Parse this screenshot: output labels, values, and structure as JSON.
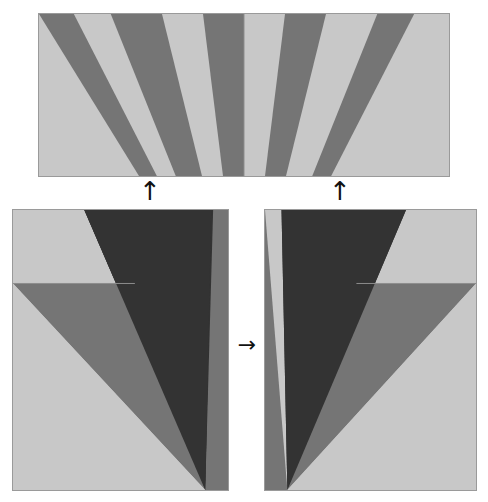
{
  "figure": {
    "title": "",
    "background_color": "#ffffff",
    "width": 488,
    "height": 502
  },
  "palette": {
    "dark": "#333333",
    "mid_dark": "#4a4a4a",
    "mid": "#757575",
    "light": "#c8c8c8",
    "border": "#9a9a9a",
    "arrow": "#111111"
  },
  "arrows": {
    "up_left": {
      "glyph": "↑",
      "label": "up-arrow-left",
      "meaning": "bottom-left panel maps into left half of top panel"
    },
    "up_right": {
      "glyph": "↑",
      "label": "up-arrow-right",
      "meaning": "bottom-right panel maps into right half of top panel"
    },
    "right_mid": {
      "glyph": "→",
      "label": "right-arrow-middle",
      "meaning": "bottom-left panel is mirrored to produce bottom-right panel"
    }
  },
  "panels": {
    "top": {
      "name": "combined-fan-panel",
      "caption": "",
      "halves": [
        "left-fan",
        "right-fan"
      ],
      "divider_x_fraction": 0.5,
      "left_fan": {
        "apex": {
          "x_fraction": 0.5,
          "y_fraction": 2.05
        },
        "wedges": [
          {
            "start_fraction": 0.0,
            "end_fraction": 0.085,
            "color": "#757575"
          },
          {
            "start_fraction": 0.085,
            "end_fraction": 0.175,
            "color": "#c8c8c8"
          },
          {
            "start_fraction": 0.175,
            "end_fraction": 0.3,
            "color": "#757575"
          },
          {
            "start_fraction": 0.3,
            "end_fraction": 0.4,
            "color": "#c8c8c8"
          },
          {
            "start_fraction": 0.4,
            "end_fraction": 0.5,
            "color": "#757575"
          }
        ]
      },
      "right_fan": {
        "apex": {
          "x_fraction": 0.5,
          "y_fraction": 2.05
        },
        "wedges": [
          {
            "start_fraction": 0.5,
            "end_fraction": 0.6,
            "color": "#c8c8c8"
          },
          {
            "start_fraction": 0.6,
            "end_fraction": 0.7,
            "color": "#757575"
          },
          {
            "start_fraction": 0.7,
            "end_fraction": 0.825,
            "color": "#c8c8c8"
          },
          {
            "start_fraction": 0.825,
            "end_fraction": 0.915,
            "color": "#757575"
          },
          {
            "start_fraction": 0.915,
            "end_fraction": 1.0,
            "color": "#c8c8c8"
          }
        ]
      }
    },
    "bottom_left": {
      "name": "source-fan-panel",
      "caption": "",
      "apex": {
        "x_fraction": 0.895,
        "y_fraction": 1.0
      },
      "background": "#c8c8c8",
      "step_line": {
        "y_fraction": 0.262,
        "x_from": 0.0,
        "x_to": 0.565
      },
      "regions": [
        {
          "id": "upper-left-light",
          "color": "#c8c8c8"
        },
        {
          "id": "dark-wedge",
          "color": "#333333",
          "top_from_fraction": 0.255,
          "top_to_fraction": 0.695
        },
        {
          "id": "mid-wedge",
          "color": "#757575",
          "top_from_fraction": 0.695,
          "top_to_fraction": 1.0
        },
        {
          "id": "lower-mid-wedge",
          "color": "#757575",
          "step_from_fraction": 0.0
        },
        {
          "id": "lower-light",
          "color": "#c8c8c8"
        }
      ]
    },
    "bottom_right": {
      "name": "mirrored-fan-panel",
      "caption": "",
      "apex": {
        "x_fraction": 0.105,
        "y_fraction": 1.0
      },
      "background": "#c8c8c8",
      "mirrored_from": "bottom_left",
      "step_line": {
        "y_fraction": 0.262,
        "x_from": 0.435,
        "x_to": 1.0
      },
      "regions": [
        {
          "id": "upper-right-light",
          "color": "#c8c8c8"
        },
        {
          "id": "dark-wedge",
          "color": "#333333",
          "top_from_fraction": 0.305,
          "top_to_fraction": 0.745
        },
        {
          "id": "mid-wedge",
          "color": "#757575",
          "top_from_fraction": 0.0,
          "top_to_fraction": 0.305
        },
        {
          "id": "lower-mid-wedge",
          "color": "#757575"
        },
        {
          "id": "lower-light",
          "color": "#c8c8c8"
        }
      ]
    }
  }
}
